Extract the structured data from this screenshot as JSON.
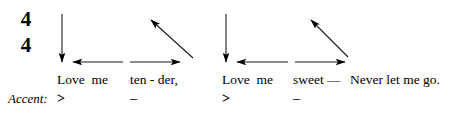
{
  "figure": {
    "kind": "conducting-pattern-diagram",
    "time_signature": {
      "top": "4",
      "bottom": "4"
    },
    "ink_color": "#000000",
    "background_color": "#ffffff"
  },
  "measures": [
    {
      "index": 1,
      "lyrics": [
        {
          "text": "Love  me",
          "left": 57
        },
        {
          "text": "ten - der,",
          "left": 130
        }
      ],
      "accents": [
        {
          "mark": ">",
          "left": 57
        },
        {
          "mark": "–",
          "left": 130
        }
      ],
      "beats": [
        {
          "name": "beat-1-down",
          "direction": "down",
          "x1": 62,
          "y1": 14,
          "x2": 62,
          "y2": 62
        },
        {
          "name": "beat-2-left",
          "direction": "left",
          "x1": 123,
          "y1": 62,
          "x2": 73,
          "y2": 62
        },
        {
          "name": "beat-3-right",
          "direction": "right",
          "x1": 130,
          "y1": 62,
          "x2": 180,
          "y2": 62
        },
        {
          "name": "beat-4-up",
          "direction": "up-left-diagonal",
          "x1": 193,
          "y1": 58,
          "x2": 151,
          "y2": 20
        }
      ]
    },
    {
      "index": 2,
      "lyrics": [
        {
          "text": "Love  me",
          "left": 222
        },
        {
          "text": "sweet —",
          "left": 293
        },
        {
          "text": "Never let me go.",
          "left": 350
        }
      ],
      "accents": [
        {
          "mark": ">",
          "left": 222
        },
        {
          "mark": "–",
          "left": 293
        }
      ],
      "beats": [
        {
          "name": "beat-1-down",
          "direction": "down",
          "x1": 226,
          "y1": 14,
          "x2": 226,
          "y2": 62
        },
        {
          "name": "beat-2-left",
          "direction": "left",
          "x1": 288,
          "y1": 62,
          "x2": 237,
          "y2": 62
        },
        {
          "name": "beat-3-right",
          "direction": "right",
          "x1": 295,
          "y1": 62,
          "x2": 345,
          "y2": 62
        },
        {
          "name": "beat-4-up",
          "direction": "up-left-diagonal",
          "x1": 348,
          "y1": 57,
          "x2": 311,
          "y2": 20
        }
      ]
    }
  ],
  "accent_row_label": "Accent:"
}
